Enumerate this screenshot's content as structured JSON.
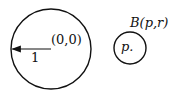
{
  "diagram": {
    "unit_ball": {
      "center_label": "(0,0)",
      "radius_label": "1"
    },
    "ball": {
      "label": "B(p,r)",
      "center_label": "p."
    },
    "colors": {
      "stroke": "#111111",
      "background": "#ffffff"
    }
  }
}
